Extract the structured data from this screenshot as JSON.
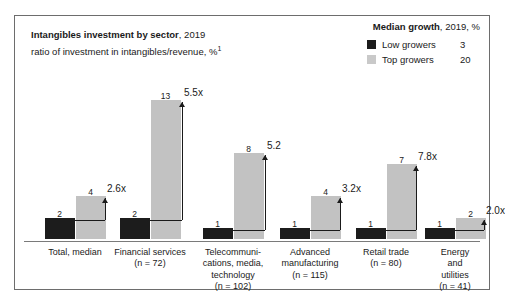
{
  "header": {
    "title_strong": "Intangibles investment by sector",
    "title_rest": ", 2019",
    "subtitle": "ratio of investment in intangibles/revenue, %",
    "subtitle_footnote": "1"
  },
  "legend": {
    "title_strong": "Median growth",
    "title_rest": ", 2019, %",
    "items": [
      {
        "label": "Low growers",
        "value": "3",
        "color": "#1c1c1c",
        "swatch": "low-growers-swatch"
      },
      {
        "label": "Top growers",
        "value": "20",
        "color": "#c9c9c9",
        "swatch": "top-growers-swatch"
      }
    ]
  },
  "chart_data": {
    "type": "bar",
    "title": "Intangibles investment by sector, 2019",
    "subtitle": "ratio of investment in intangibles/revenue, %",
    "xlabel": "",
    "ylabel": "ratio of investment in intangibles/revenue, %",
    "ylim": [
      0,
      14
    ],
    "grid": false,
    "legend_position": "top-right",
    "categories": [
      "Total, median",
      "Financial services (n = 72)",
      "Telecommunications, media, technology (n = 102)",
      "Advanced manufacturing (n = 115)",
      "Retail trade (n = 80)",
      "Energy and utilities (n = 41)"
    ],
    "series": [
      {
        "name": "Low growers",
        "color": "#1c1c1c",
        "values": [
          2,
          2,
          1,
          1,
          1,
          1
        ]
      },
      {
        "name": "Top growers",
        "color": "#c2c2c2",
        "values": [
          4,
          13,
          8,
          4,
          7,
          2
        ]
      }
    ],
    "ratio_annotations": [
      "2.6x",
      "5.5x",
      "5.2",
      "3.2x",
      "7.8x",
      "2.0x"
    ]
  },
  "groups": [
    {
      "name": "total-median",
      "lines": [
        "Total, median"
      ],
      "low": "2",
      "top": "4",
      "ratio": "2.6x"
    },
    {
      "name": "financial-services",
      "lines": [
        "Financial services",
        "(n = 72)"
      ],
      "low": "2",
      "top": "13",
      "ratio": "5.5x"
    },
    {
      "name": "telecommunications-media-technology",
      "lines": [
        "Telecommuni-",
        "cations, media,",
        "technology",
        "(n = 102)"
      ],
      "low": "1",
      "top": "8",
      "ratio": "5.2"
    },
    {
      "name": "advanced-manufacturing",
      "lines": [
        "Advanced",
        "manufacturing",
        "(n = 115)"
      ],
      "low": "1",
      "top": "4",
      "ratio": "3.2x"
    },
    {
      "name": "retail-trade",
      "lines": [
        "Retail trade",
        "(n = 80)"
      ],
      "low": "1",
      "top": "7",
      "ratio": "7.8x"
    },
    {
      "name": "energy-and-utilities",
      "lines": [
        "Energy and utilities",
        "(n = 41)"
      ],
      "low": "1",
      "top": "2",
      "ratio": "2.0x"
    }
  ]
}
